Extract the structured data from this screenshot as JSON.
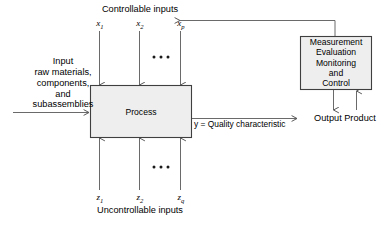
{
  "figure": {
    "title_top": "Controllable inputs",
    "title_bottom": "Uncontrollable inputs"
  },
  "colors": {
    "line": "#595959",
    "box_border": "#3f3f3f",
    "box_fill": "#eeeeee",
    "text": "#000000",
    "dot": "#1a1a1a"
  },
  "controllable_inputs": {
    "label": "Controllable inputs",
    "variables": [
      {
        "base": "x",
        "sub": "1"
      },
      {
        "base": "x",
        "sub": "2"
      },
      {
        "base": "x",
        "sub": "p"
      }
    ],
    "ellipsis": "• • •"
  },
  "uncontrollable_inputs": {
    "label": "Uncontrollable inputs",
    "variables": [
      {
        "base": "z",
        "sub": "1"
      },
      {
        "base": "z",
        "sub": "2"
      },
      {
        "base": "z",
        "sub": "q"
      }
    ],
    "ellipsis": "• • •"
  },
  "process_box": {
    "label": "Process"
  },
  "measurement_box": {
    "lines": [
      "Measurement",
      "Evaluation",
      "Monitoring",
      "and",
      "Control"
    ]
  },
  "input_label": {
    "lines": [
      "Input",
      "raw materials,",
      "components,",
      "and",
      "subassemblies"
    ]
  },
  "output_label": {
    "text": "y = Quality characteristic"
  },
  "output_product": {
    "text": "Output Product"
  }
}
